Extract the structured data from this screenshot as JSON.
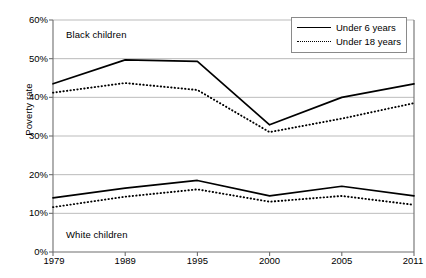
{
  "chart_data": {
    "type": "line",
    "title": "",
    "xlabel": "",
    "ylabel": "Poverty rate",
    "categories": [
      "1979",
      "1989",
      "1995",
      "2000",
      "2005",
      "2011"
    ],
    "x": [
      1979,
      1989,
      1995,
      2000,
      2005,
      2011
    ],
    "ylim": [
      0,
      60
    ],
    "ytick_values": [
      0,
      10,
      20,
      30,
      40,
      50,
      60
    ],
    "ytick_labels": [
      "0%",
      "10%",
      "20%",
      "30%",
      "40%",
      "50%",
      "60%"
    ],
    "grid": "horizontal",
    "legend_position": "top-right",
    "legend_entries": [
      "Under 6 years",
      "Under 18 years"
    ],
    "annotations": [
      {
        "text": "Black children",
        "x_category": "1979",
        "y": 56
      },
      {
        "text": "White children",
        "x_category": "1979",
        "y": 5
      }
    ],
    "series": [
      {
        "name": "Black children, Under 6 years",
        "group": "Black children",
        "style": "solid",
        "values": [
          43.5,
          49.7,
          49.3,
          32.9,
          40.0,
          43.5
        ]
      },
      {
        "name": "Black children, Under 18 years",
        "group": "Black children",
        "style": "dotted",
        "values": [
          41.2,
          43.7,
          41.9,
          31.0,
          34.5,
          38.5
        ]
      },
      {
        "name": "White children, Under 6 years",
        "group": "White children",
        "style": "solid",
        "values": [
          14.0,
          16.5,
          18.5,
          14.5,
          17.0,
          14.5
        ]
      },
      {
        "name": "White children, Under 18 years",
        "group": "White children",
        "style": "dotted",
        "values": [
          11.6,
          14.3,
          16.2,
          13.0,
          14.5,
          12.2
        ]
      }
    ]
  },
  "axes": {
    "y_title": "Poverty rate"
  },
  "legend": {
    "items": [
      {
        "label": "Under 6 years",
        "style": "solid"
      },
      {
        "label": "Under 18 years",
        "style": "dotted"
      }
    ]
  },
  "colors": {
    "line": "#000000",
    "grid": "#aaaaaa",
    "axis": "#6e6e6e",
    "background": "#ffffff"
  }
}
